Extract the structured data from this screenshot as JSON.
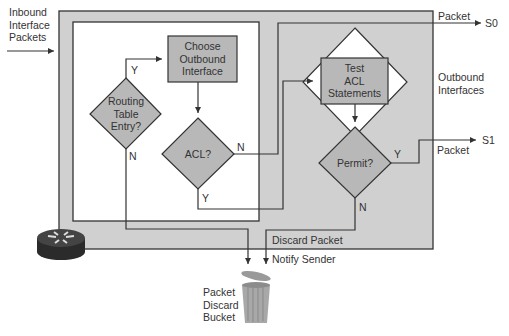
{
  "inbound": {
    "line1": "Inbound",
    "line2": "Interface",
    "line3": "Packets"
  },
  "nodes": {
    "routing_table": {
      "line1": "Routing",
      "line2": "Table",
      "line3": "Entry?"
    },
    "choose_outbound": {
      "line1": "Choose",
      "line2": "Outbound",
      "line3": "Interface"
    },
    "acl": {
      "label": "ACL?"
    },
    "test_acl": {
      "line1": "Test",
      "line2": "ACL",
      "line3": "Statements"
    },
    "permit": {
      "label": "Permit?"
    }
  },
  "branches": {
    "routing_y": "Y",
    "routing_n": "N",
    "acl_n": "N",
    "acl_y": "Y",
    "permit_y": "Y",
    "permit_n": "N"
  },
  "outputs": {
    "packet_s0": "Packet",
    "s0": "S0",
    "outbound_line1": "Outbound",
    "outbound_line2": "Interfaces",
    "packet_s1": "Packet",
    "s1": "S1",
    "discard_packet": "Discard Packet",
    "notify_sender": "Notify Sender"
  },
  "bucket": {
    "line1": "Packet",
    "line2": "Discard",
    "line3": "Bucket"
  },
  "colors": {
    "outer_box": "#d0d0d0",
    "node_fill": "#b8b8b8",
    "line": "#333333",
    "router_body": "#2b2b2b"
  }
}
